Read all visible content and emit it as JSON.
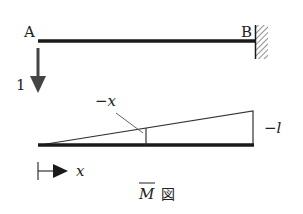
{
  "figure": {
    "beam": {
      "left_label": "A",
      "right_label": "B",
      "support": "fixed-wall"
    },
    "load": {
      "label": "1",
      "direction": "down"
    },
    "moment_diagram": {
      "value_at_x_label": "−x",
      "value_at_end_label": "−l",
      "axis_label": "x",
      "title_symbol": "M",
      "title_suffix": "図"
    }
  },
  "colors": {
    "ink": "#1a1a1a",
    "diagram_line": "#333333",
    "hatch": "#444444"
  }
}
